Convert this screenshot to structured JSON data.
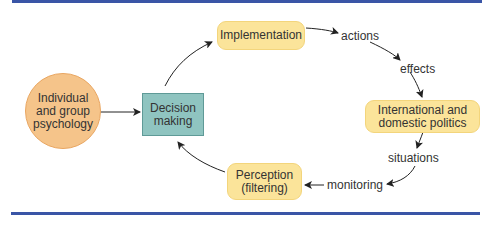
{
  "diagram": {
    "title": "",
    "colors": {
      "rule": "#3a55a6",
      "circle_fill": "#f5c48a",
      "rect_fill": "#8fc4c0",
      "pill_fill": "#fbe49a",
      "arrow": "#222222"
    },
    "nodes": {
      "psychology": {
        "line1": "Individual",
        "line2": "and group",
        "line3": "psychology"
      },
      "decision": {
        "line1": "Decision",
        "line2": "making"
      },
      "implementation": {
        "line1": "Implementation"
      },
      "politics": {
        "line1": "International and",
        "line2": "domestic politics"
      },
      "perception": {
        "line1": "Perception",
        "line2": "(filtering)"
      }
    },
    "edge_labels": {
      "actions": "actions",
      "effects": "effects",
      "situations": "situations",
      "monitoring": "monitoring"
    }
  }
}
